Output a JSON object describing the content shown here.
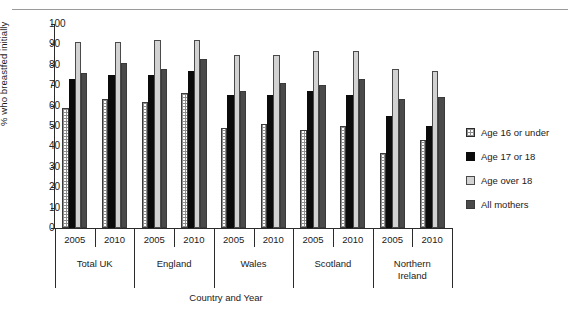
{
  "chart_data": {
    "type": "bar",
    "title": "",
    "xlabel": "Country and Year",
    "ylabel": "% who breastfed initially",
    "ylim": [
      0,
      100
    ],
    "ytick_labels": [
      "0",
      "10",
      "20",
      "30",
      "40",
      "50",
      "60",
      "70",
      "80",
      "90",
      "100"
    ],
    "ytick_values": [
      0,
      10,
      20,
      30,
      40,
      50,
      60,
      70,
      80,
      90,
      100
    ],
    "grid": false,
    "legend_position": "right",
    "categories": [
      "Total UK 2005",
      "Total UK 2010",
      "England 2005",
      "England 2010",
      "Wales 2005",
      "Wales 2010",
      "Scotland 2005",
      "Scotland 2010",
      "Northern Ireland 2005",
      "Northern Ireland 2010"
    ],
    "groups": [
      {
        "country": "Total UK",
        "years": [
          "2005",
          "2010"
        ]
      },
      {
        "country": "England",
        "years": [
          "2005",
          "2010"
        ]
      },
      {
        "country": "Wales",
        "years": [
          "2005",
          "2010"
        ]
      },
      {
        "country": "Scotland",
        "years": [
          "2005",
          "2010"
        ]
      },
      {
        "country": "Northern Ireland",
        "years": [
          "2005",
          "2010"
        ]
      }
    ],
    "series": [
      {
        "name": "Age 16 or under",
        "color": "#ffffff",
        "pattern": "dotted",
        "values": [
          59,
          63,
          62,
          66,
          49,
          51,
          48,
          50,
          37,
          43
        ]
      },
      {
        "name": "Age 17 or 18",
        "color": "#0b0b0b",
        "pattern": "solid",
        "values": [
          73,
          75,
          75,
          77,
          65,
          65,
          67,
          65,
          55,
          50
        ]
      },
      {
        "name": "Age over 18",
        "color": "#d2d2d2",
        "pattern": "solid",
        "values": [
          91,
          91,
          92,
          92,
          85,
          85,
          87,
          87,
          78,
          77
        ]
      },
      {
        "name": "All mothers",
        "color": "#4a4a4a",
        "pattern": "solid",
        "values": [
          76,
          81,
          78,
          83,
          67,
          71,
          70,
          73,
          63,
          64
        ]
      }
    ]
  },
  "legend": {
    "items": [
      {
        "label": "Age 16 or under"
      },
      {
        "label": "Age 17 or 18"
      },
      {
        "label": "Age over 18"
      },
      {
        "label": "All mothers"
      }
    ]
  }
}
